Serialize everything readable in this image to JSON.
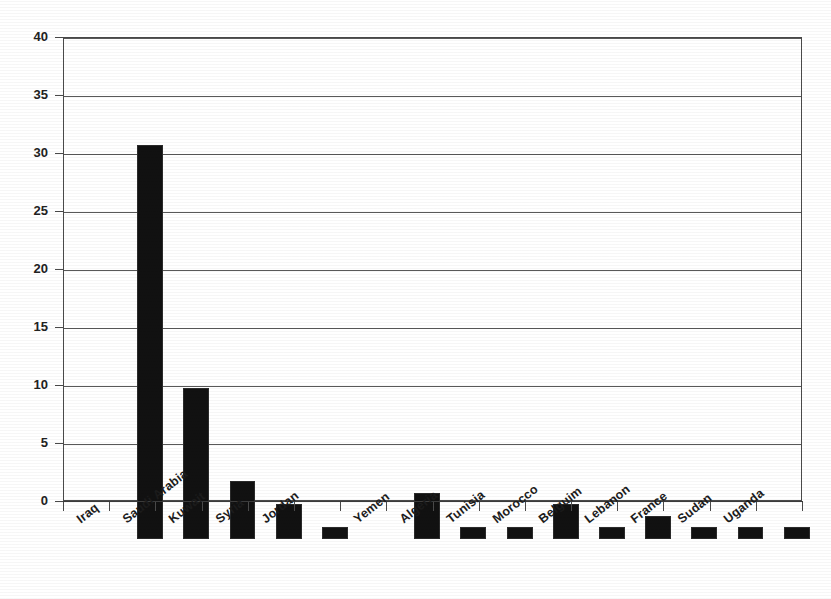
{
  "chart_data": {
    "type": "bar",
    "title": "",
    "subtitle": "",
    "xlabel": "",
    "ylabel": "",
    "ylim": [
      0,
      40
    ],
    "ytick_step": 5,
    "yticks": [
      0,
      5,
      10,
      15,
      20,
      25,
      30,
      35,
      40
    ],
    "ytick_labels": [
      "0",
      "5",
      "10",
      "15",
      "20",
      "25",
      "30",
      "35",
      "40"
    ],
    "grid": true,
    "grid_axis": "y",
    "legend": false,
    "legend_position": "none",
    "bar_color": "#111111",
    "categories": [
      "Iraq",
      "Saudi Arabia",
      "Kuwait",
      "Syria",
      "Jordan",
      "",
      "Yemen",
      "Algeria",
      "Tunisia",
      "Morocco",
      "Belguim",
      "Lebanon",
      "France",
      "Sudan",
      "Uganda"
    ],
    "values": [
      34,
      13,
      5,
      3,
      1,
      0,
      4,
      1,
      1,
      3,
      1,
      2,
      1,
      1,
      1
    ],
    "slot_count": 16
  },
  "axes": {
    "y_axis_name": "y-axis",
    "x_axis_name": "x-axis"
  }
}
